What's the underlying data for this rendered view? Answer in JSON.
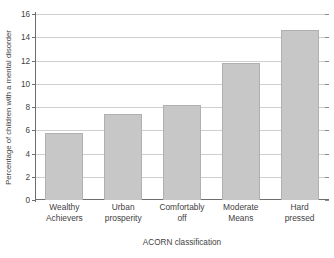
{
  "chart_data": {
    "type": "bar",
    "title": "",
    "subtitle": "",
    "categories": [
      "Wealthy Achievers",
      "Urban prosperity",
      "Comfortably off",
      "Moderate Means",
      "Hard pressed"
    ],
    "category_lines": [
      [
        "Wealthy",
        "Achievers"
      ],
      [
        "Urban",
        "prosperity"
      ],
      [
        "Comfortably",
        "off"
      ],
      [
        "Moderate",
        "Means"
      ],
      [
        "Hard",
        "pressed"
      ]
    ],
    "values": [
      5.8,
      7.4,
      8.2,
      11.8,
      14.6
    ],
    "xlabel": "ACORN classification",
    "ylabel": "Percentage of children with a mental disorder",
    "ylim": [
      0,
      16
    ],
    "ytick_step": 2,
    "yticks": [
      0,
      2,
      4,
      6,
      8,
      10,
      12,
      14,
      16
    ],
    "ytick_labels": [
      "0",
      "2",
      "4",
      "6",
      "8",
      "10",
      "12",
      "14",
      "16"
    ],
    "grid": true,
    "grid_axis": "y",
    "legend": false,
    "legend_position": "none",
    "bar_fill_color": "#c7c7c7",
    "bar_edge_color": "#b0b0b0",
    "gridline_color": "#cfcfcf",
    "axis_color": "#6d6d6d",
    "text_color": "#3f3f3f",
    "background_color": "#ffffff"
  }
}
